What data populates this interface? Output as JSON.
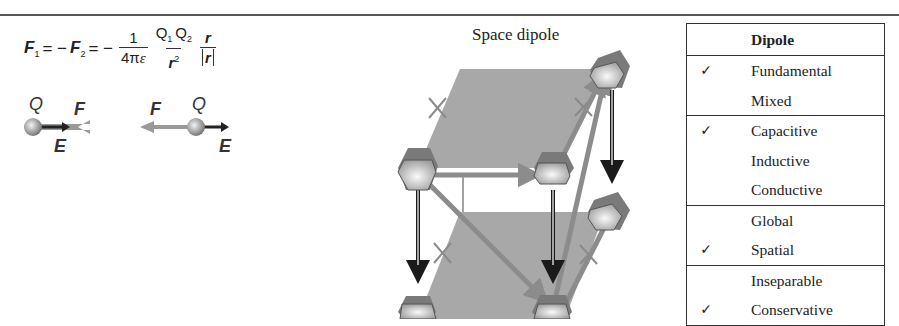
{
  "formula": {
    "lhs1": "F",
    "lhs1_sub": "1",
    "eq1": " = −",
    "lhs2": "F",
    "lhs2_sub": "2",
    "eq2": " = −",
    "frac1_num": "1",
    "frac1_den_a": "4π",
    "frac1_den_b": "ε",
    "frac2_num_q1": "Q",
    "frac2_num_q1_sub": "1",
    "frac2_num_q2": "Q",
    "frac2_num_q2_sub": "2",
    "frac2_den": "r",
    "frac2_den_sup": "2",
    "frac3_num": "r",
    "frac3_den": "r"
  },
  "charges": {
    "left": {
      "charge": "Q",
      "force": "F",
      "field": "E"
    },
    "right": {
      "charge": "Q",
      "force": "F",
      "field": "E"
    }
  },
  "diagram": {
    "title": "Space dipole",
    "colors": {
      "plane": "#a8a8a8",
      "node": "#c9c9c9",
      "node_cap": "#7a7a7a",
      "arrow_dark": "#1a1a1a",
      "arrow_gray": "#8c8c8c",
      "cross": "#8a8a8a"
    }
  },
  "table": {
    "header": "Dipole",
    "check_glyph": "✓",
    "groups": [
      {
        "rows": [
          {
            "checked": true,
            "label": "Fundamental"
          },
          {
            "checked": false,
            "label": "Mixed"
          }
        ]
      },
      {
        "rows": [
          {
            "checked": true,
            "label": "Capacitive"
          },
          {
            "checked": false,
            "label": "Inductive"
          },
          {
            "checked": false,
            "label": "Conductive"
          }
        ]
      },
      {
        "rows": [
          {
            "checked": false,
            "label": "Global"
          },
          {
            "checked": true,
            "label": "Spatial"
          }
        ]
      },
      {
        "rows": [
          {
            "checked": false,
            "label": "Inseparable"
          },
          {
            "checked": true,
            "label": "Conservative"
          }
        ]
      }
    ],
    "marks": [
      "✓",
      "",
      "✓",
      "",
      "",
      "",
      "✓",
      "",
      "✓"
    ]
  }
}
